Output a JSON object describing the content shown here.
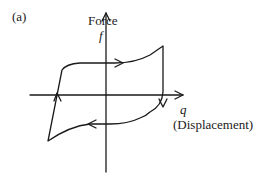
{
  "figure": {
    "panel_label": "(a)",
    "y_axis": {
      "label": "Force",
      "symbol": "f"
    },
    "x_axis": {
      "symbol": "q",
      "label": "(Displacement)"
    },
    "curve": {
      "description": "Hysteresis loop traversed clockwise",
      "direction": "clockwise",
      "stroke_color": "#1a1a1a"
    }
  }
}
